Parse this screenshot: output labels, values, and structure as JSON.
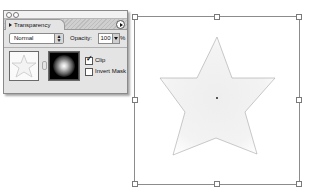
{
  "panel": {
    "tab_label": "Transparency",
    "blend_mode": "Normal",
    "opacity_label": "Opacity:",
    "opacity_value": "100",
    "opacity_unit": "%",
    "checkboxes": [
      {
        "label": "Clip",
        "checked": true,
        "check_glyph": "✓"
      },
      {
        "label": "Invert Mask",
        "checked": false,
        "check_glyph": ""
      }
    ],
    "thumbnails": {
      "artwork": "star-thumbnail",
      "mask": "radial-gradient-mask"
    }
  },
  "canvas": {
    "selected_object": "star",
    "star_fill": "#f1f1f1",
    "star_stroke": "#9a9a9a",
    "bounding_box_color": "#8c8c8c"
  },
  "icons": {
    "blend_arrows": "⇕",
    "panel_menu": "triangle-right",
    "tab_collapse": "triangle-right"
  }
}
